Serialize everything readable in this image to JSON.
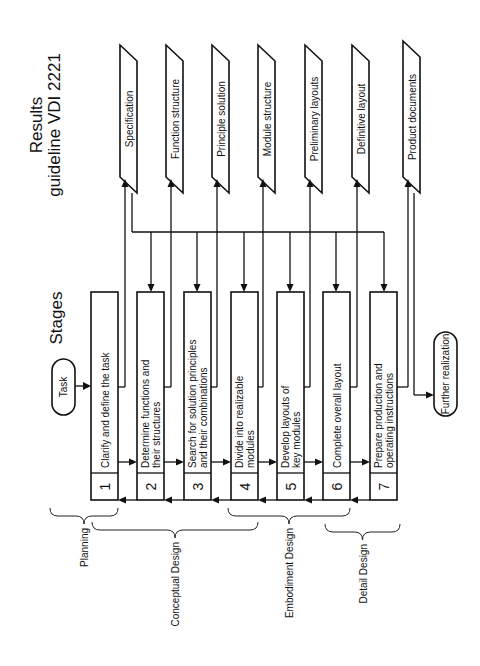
{
  "headers": {
    "stages": "Stages",
    "results_line1": "Results",
    "results_line2": "guideline VDI 2221"
  },
  "start": {
    "label": "Task"
  },
  "end": {
    "label": "Further realization"
  },
  "stages": [
    {
      "number": "1",
      "line1": "Clarify and define the task",
      "line2": ""
    },
    {
      "number": "2",
      "line1": "Determine functions and",
      "line2": "their structures"
    },
    {
      "number": "3",
      "line1": "Search for solution principles",
      "line2": "and their combinations"
    },
    {
      "number": "4",
      "line1": "Divide into realizable",
      "line2": "modules"
    },
    {
      "number": "5",
      "line1": "Develop layouts of",
      "line2": "key modules"
    },
    {
      "number": "6",
      "line1": "Complete overall layout",
      "line2": ""
    },
    {
      "number": "7",
      "line1": "Prepare production and",
      "line2": "operating instructions"
    }
  ],
  "results": [
    {
      "label": "Specification"
    },
    {
      "label": "Function structure"
    },
    {
      "label": "Principle solution"
    },
    {
      "label": "Module structure"
    },
    {
      "label": "Preliminary layouts"
    },
    {
      "label": "Definitive layout"
    },
    {
      "label": "Product documents"
    }
  ],
  "phases": [
    {
      "label": "Planning"
    },
    {
      "label": "Conceptual Design"
    },
    {
      "label": "Embodiment Design"
    },
    {
      "label": "Detail Design"
    }
  ]
}
